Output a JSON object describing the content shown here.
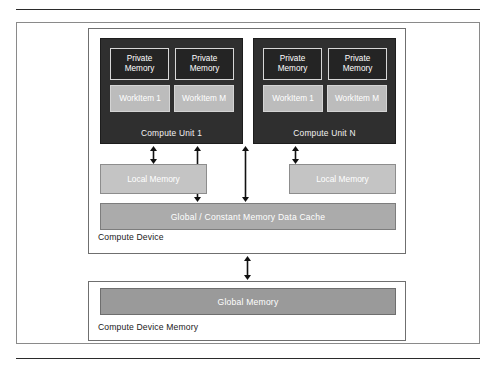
{
  "compute_device": {
    "caption": "Compute Device",
    "compute_units": [
      {
        "label": "Compute Unit 1",
        "private_memories": [
          {
            "line1": "Private",
            "line2": "Memory"
          },
          {
            "line1": "Private",
            "line2": "Memory"
          }
        ],
        "work_items": [
          {
            "label": "WorkItem 1"
          },
          {
            "label": "WorkItem M"
          }
        ]
      },
      {
        "label": "Compute Unit N",
        "private_memories": [
          {
            "line1": "Private",
            "line2": "Memory"
          },
          {
            "line1": "Private",
            "line2": "Memory"
          }
        ],
        "work_items": [
          {
            "label": "WorkItem 1"
          },
          {
            "label": "WorkItem M"
          }
        ]
      }
    ],
    "local_memories": [
      {
        "label": "Local Memory"
      },
      {
        "label": "Local Memory"
      }
    ],
    "cache": {
      "label": "Global / Constant Memory Data Cache"
    }
  },
  "device_memory": {
    "caption": "Compute Device Memory",
    "global_memory": {
      "label": "Global Memory"
    }
  },
  "colors": {
    "compute_unit_fill": "#2f2f2f",
    "private_memory_fill": "#242424",
    "work_item_fill": "#bcbcbc",
    "local_memory_fill": "#c4c4c4",
    "cache_fill": "#ababab",
    "global_memory_fill": "#9a9a9a",
    "frame_stroke": "#8a8a8a",
    "arrow_stroke": "#111111",
    "page_background": "#ffffff"
  },
  "arrows": [
    {
      "name": "cu1-to-local-memory",
      "kind": "double-headed-vertical"
    },
    {
      "name": "cu1-to-global-cache",
      "kind": "double-headed-vertical"
    },
    {
      "name": "cu2-to-global-cache",
      "kind": "double-headed-vertical"
    },
    {
      "name": "cu2-to-local-memory",
      "kind": "double-headed-vertical"
    },
    {
      "name": "compute-device-to-device-memory",
      "kind": "double-headed-vertical"
    }
  ]
}
